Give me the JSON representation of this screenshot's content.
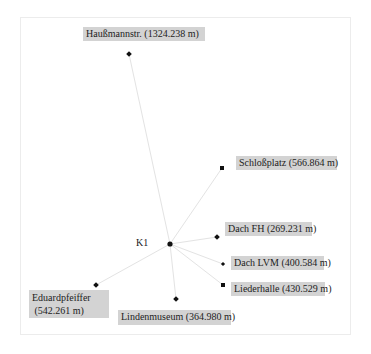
{
  "diagram": {
    "center": {
      "label": "K1",
      "x": 170,
      "y": 244
    },
    "colors": {
      "edge": "#e6e6e6",
      "label_bg": "#d3d3d3",
      "node": "#111111",
      "frame": "#ececec"
    },
    "nodes": [
      {
        "name": "Haußmannstr.",
        "distance": "1324.238 m",
        "label": "Haußmannstr. (1324.238 m)",
        "x": 129,
        "y": 54
      },
      {
        "name": "Schloßplatz",
        "distance": "566.864 m",
        "label": "Schloßplatz (566.864 m)",
        "x": 222,
        "y": 168
      },
      {
        "name": "Dach FH",
        "distance": "269.231 m",
        "label": "Dach FH (269.231 m)",
        "x": 217,
        "y": 237
      },
      {
        "name": "Dach LVM",
        "distance": "400.584 m",
        "label": "Dach LVM (400.584 m)",
        "x": 223,
        "y": 264
      },
      {
        "name": "Liederhalle",
        "distance": "430.529 m",
        "label": "Liederhalle (430.529 m)",
        "x": 223,
        "y": 285
      },
      {
        "name": "Lindenmuseum",
        "distance": "364.980 m",
        "label": "Lindenmuseum (364.980 m)",
        "x": 176,
        "y": 299
      },
      {
        "name": "Eduardpfeiffer",
        "distance": "542.261 m",
        "label": "Eduardpfeiffer\n (542.261 m)",
        "x": 96,
        "y": 285
      }
    ]
  },
  "labels": {
    "k1": "K1",
    "haussmann": "Haußmannstr. (1324.238 m)",
    "schlossplatz": "Schloßplatz (566.864 m)",
    "dach_fh": "Dach FH (269.231 m)",
    "dach_lvm": "Dach LVM (400.584 m)",
    "liederhalle": "Liederhalle (430.529 m)",
    "lindenmuseum": "Lindenmuseum (364.980 m)",
    "eduardpfeiffer": "Eduardpfeiffer\n (542.261 m)"
  }
}
